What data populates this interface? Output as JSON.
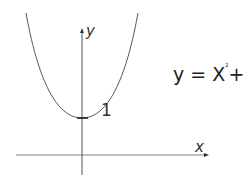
{
  "diagram": {
    "equation": {
      "lhs": "y = X",
      "exponent": "2",
      "rhs": "+ 1"
    },
    "axes": {
      "x_label": "x",
      "y_label": "y"
    },
    "annotations": {
      "y_intercept_label": "1"
    },
    "curve": {
      "type": "parabola",
      "vertex": [
        0,
        1
      ],
      "opens": "up"
    },
    "colors": {
      "line": "#444444",
      "axis": "#555555",
      "text": "#222222"
    }
  }
}
